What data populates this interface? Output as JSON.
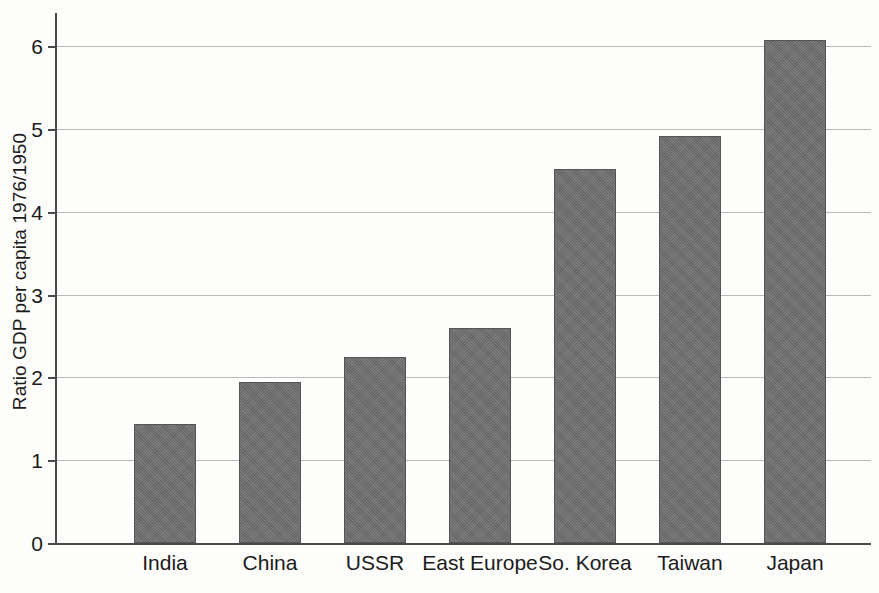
{
  "chart_data": {
    "type": "bar",
    "title": "",
    "subtitle": "",
    "xlabel": "",
    "ylabel": "Ratio GDP per capita 1976/1950",
    "categories": [
      "India",
      "China",
      "USSR",
      "East Europe",
      "So. Korea",
      "Taiwan",
      "Japan"
    ],
    "values": [
      1.44,
      1.95,
      2.25,
      2.6,
      4.52,
      4.91,
      6.07
    ],
    "ylim": [
      0,
      6.4
    ],
    "yticks": [
      0,
      1,
      2,
      3,
      4,
      5,
      6
    ],
    "ytick_labels": [
      "0",
      "1",
      "2",
      "3",
      "4",
      "5",
      "6"
    ],
    "grid": true,
    "grid_axis": "y",
    "legend": false,
    "legend_position": "none",
    "bar_color": "#6e6e6e",
    "bar_edge_color": "#555555",
    "axis_color": "#4a4a4a",
    "gridline_color": "#b9b9b9",
    "background_color": "#fdfdfc",
    "annotations": []
  }
}
